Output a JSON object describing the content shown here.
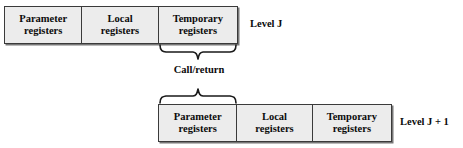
{
  "diagram": {
    "colors": {
      "cell_fill": "#ececec",
      "border": "#3a3a3a",
      "shadow": "#777777",
      "text": "#0b0b0b",
      "background": "#ffffff"
    },
    "windows": [
      {
        "id": "level-j",
        "level_label": "Level J",
        "cells": [
          {
            "line1": "Parameter",
            "line2": "registers"
          },
          {
            "line1": "Local",
            "line2": "registers"
          },
          {
            "line1": "Temporary",
            "line2": "registers"
          }
        ]
      },
      {
        "id": "level-j-plus-1",
        "level_label": "Level J + 1",
        "cells": [
          {
            "line1": "Parameter",
            "line2": "registers"
          },
          {
            "line1": "Local",
            "line2": "registers"
          },
          {
            "line1": "Temporary",
            "line2": "registers"
          }
        ]
      }
    ],
    "connector": {
      "label": "Call/return",
      "top_brace_over": "Temporary registers",
      "bottom_brace_over": "Parameter registers"
    }
  }
}
